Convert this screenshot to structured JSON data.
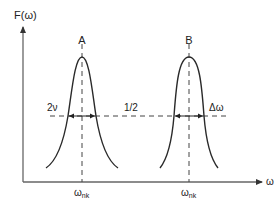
{
  "diagram": {
    "y_axis_label": "F(ω)",
    "x_axis_label": "ω",
    "peaks": [
      {
        "name": "A",
        "center_label": "ω",
        "center_sub": "nk"
      },
      {
        "name": "B",
        "center_label": "ω",
        "center_sub": "nk"
      }
    ],
    "width_label_left": "2ν",
    "half_max_label": "1/2",
    "width_label_right": "Δω",
    "colors": {
      "line": "#2a2a2a",
      "axis": "#555555",
      "dash": "#444444"
    }
  }
}
